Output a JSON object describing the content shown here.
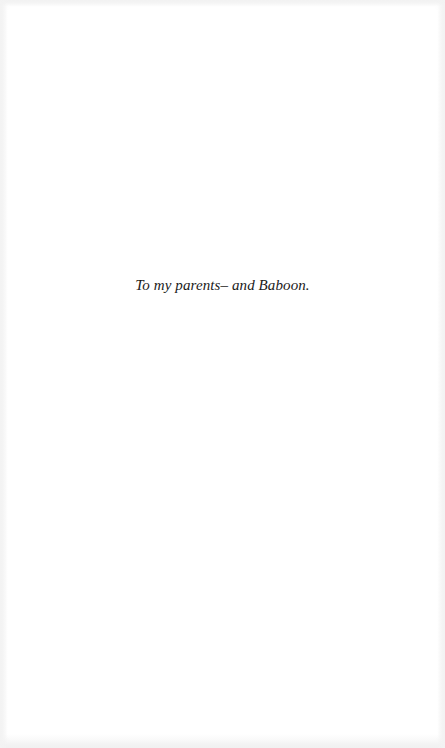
{
  "page": {
    "dedication_text": "To my parents– and Baboon."
  },
  "colors": {
    "background": "#ffffff",
    "text": "#1a1a1a"
  }
}
